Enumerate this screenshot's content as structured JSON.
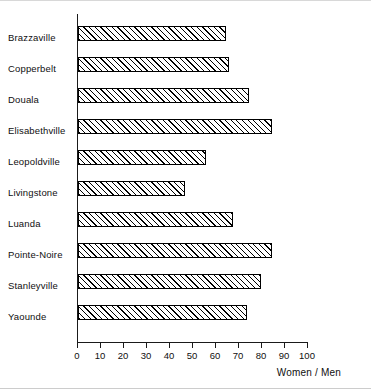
{
  "chart_data": {
    "type": "bar",
    "orientation": "horizontal",
    "title": "",
    "subtitle": "",
    "xlabel": "Women / Men",
    "ylabel": "",
    "xlim": [
      0,
      100
    ],
    "xticks": [
      0,
      10,
      20,
      30,
      40,
      50,
      60,
      70,
      80,
      90,
      100
    ],
    "xtick_labels": [
      "0",
      "10",
      "20",
      "30",
      "40",
      "50",
      "60",
      "70",
      "80",
      "90",
      "100"
    ],
    "grid": false,
    "legend": null,
    "categories": [
      "Brazzaville",
      "Copperbelt",
      "Douala",
      "Elisabethville",
      "Leopoldville",
      "Livingstone",
      "Luanda",
      "Pointe-Noire",
      "Stanleyville",
      "Yaounde"
    ],
    "values": [
      64,
      65,
      74,
      84,
      55,
      46,
      67,
      84,
      79,
      73
    ],
    "bar_style": {
      "fill": "diagonal-hatch",
      "edge_color": "#000000",
      "face_color": "#ffffff"
    }
  },
  "figure": {
    "background_color": "#ffffff",
    "axis_color": "#1a1a1a",
    "text_color": "#0f0f0f",
    "border_color": "#d8d8d8"
  }
}
